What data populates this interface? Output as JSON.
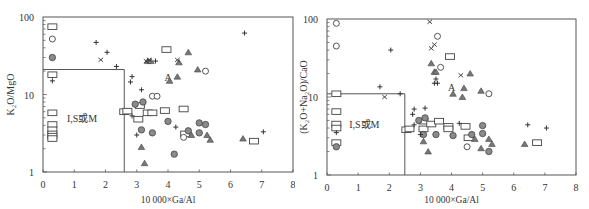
{
  "chart_data": [
    {
      "type": "scatter",
      "title": "",
      "xlabel": "10 000×Ga/Al",
      "ylabel": "K2O/MgO",
      "ylabel_display": "K₂O/MgO",
      "xlim": [
        0,
        8
      ],
      "ylim": [
        1,
        100
      ],
      "yscale": "log",
      "xticks": [
        "0",
        "1",
        "2",
        "3",
        "4",
        "5",
        "6",
        "7",
        "8"
      ],
      "yticks": [
        "1",
        "10",
        "100"
      ],
      "grid": false,
      "field_labels": [
        {
          "text": "I,S或M",
          "x": 1.25,
          "y": 5.0
        },
        {
          "text": "A",
          "x": 4.0,
          "y": 17.0
        }
      ],
      "boundary": {
        "x": 2.6,
        "y": 21
      },
      "series": [
        {
          "name": "square",
          "marker": "open-square",
          "points": [
            [
              0.3,
              75
            ],
            [
              0.3,
              18
            ],
            [
              0.3,
              5.8
            ],
            [
              0.3,
              4.1
            ],
            [
              0.3,
              3.5
            ],
            [
              0.3,
              3.1
            ],
            [
              0.3,
              2.9
            ],
            [
              0.3,
              2.7
            ],
            [
              2.6,
              6.0
            ],
            [
              2.7,
              6.1
            ],
            [
              3.05,
              4.8
            ],
            [
              3.1,
              7.2
            ],
            [
              3.35,
              5.8
            ],
            [
              3.5,
              5.8
            ],
            [
              3.9,
              6.2
            ],
            [
              3.95,
              38
            ],
            [
              4.5,
              6.5
            ],
            [
              4.55,
              3.1
            ],
            [
              6.75,
              2.5
            ]
          ]
        },
        {
          "name": "open-circle",
          "marker": "open-circle",
          "points": [
            [
              0.3,
              52
            ],
            [
              3.5,
              9.5
            ],
            [
              3.65,
              9.5
            ],
            [
              4.5,
              2.8
            ],
            [
              5.2,
              20
            ]
          ]
        },
        {
          "name": "filled-circle",
          "marker": "filled-circle",
          "points": [
            [
              0.3,
              30
            ],
            [
              2.95,
              7.5
            ],
            [
              3.2,
              8.0
            ],
            [
              3.15,
              3.5
            ],
            [
              3.5,
              3.2
            ],
            [
              4.0,
              4.5
            ],
            [
              4.2,
              1.7
            ],
            [
              4.65,
              3.4
            ],
            [
              5.0,
              4.3
            ],
            [
              5.0,
              3.2
            ],
            [
              5.2,
              4.1
            ]
          ]
        },
        {
          "name": "filled-triangle",
          "marker": "triangle",
          "points": [
            [
              3.15,
              2.1
            ],
            [
              3.25,
              1.3
            ],
            [
              3.35,
              27
            ],
            [
              3.45,
              27
            ],
            [
              4.05,
              15
            ],
            [
              4.3,
              17
            ],
            [
              4.35,
              26
            ],
            [
              4.65,
              35
            ],
            [
              4.75,
              3.0
            ],
            [
              4.95,
              21
            ],
            [
              5.25,
              3.0
            ],
            [
              5.35,
              2.6
            ],
            [
              6.4,
              2.7
            ]
          ]
        },
        {
          "name": "plus",
          "marker": "plus",
          "points": [
            [
              0.3,
              15
            ],
            [
              1.7,
              47
            ],
            [
              2.05,
              35
            ],
            [
              2.35,
              23
            ],
            [
              2.8,
              14.5
            ],
            [
              2.85,
              17
            ],
            [
              3.15,
              11.5
            ],
            [
              2.85,
              5.3
            ],
            [
              3.0,
              3.0
            ],
            [
              3.6,
              27
            ],
            [
              4.25,
              3.8
            ],
            [
              6.45,
              62
            ],
            [
              7.05,
              3.3
            ]
          ]
        },
        {
          "name": "cross",
          "marker": "x",
          "points": [
            [
              1.85,
              28
            ],
            [
              3.3,
              27
            ],
            [
              3.4,
              28
            ],
            [
              4.3,
              28
            ]
          ]
        }
      ]
    },
    {
      "type": "scatter",
      "title": "",
      "xlabel": "10 000×Ga/Al",
      "ylabel": "(K2O+Na2O)/CaO",
      "ylabel_display": "(K₂O+Na₂O)/CaO",
      "xlim": [
        0,
        8
      ],
      "ylim": [
        1,
        100
      ],
      "yscale": "log",
      "xticks": [
        "0",
        "1",
        "2",
        "3",
        "4",
        "5",
        "6",
        "7",
        "8"
      ],
      "yticks": [
        "1",
        "10",
        "100"
      ],
      "grid": false,
      "field_labels": [
        {
          "text": "I,S或M",
          "x": 1.2,
          "y": 4.5
        },
        {
          "text": "A",
          "x": 4.0,
          "y": 13.5
        }
      ],
      "boundary": {
        "x": 2.5,
        "y": 11
      },
      "series": [
        {
          "name": "square",
          "marker": "open-square",
          "points": [
            [
              0.3,
              11
            ],
            [
              0.3,
              6.5
            ],
            [
              0.3,
              4.5
            ],
            [
              0.3,
              4.0
            ],
            [
              0.3,
              2.6
            ],
            [
              2.55,
              3.8
            ],
            [
              2.65,
              3.9
            ],
            [
              3.1,
              4.9
            ],
            [
              3.1,
              3.9
            ],
            [
              3.35,
              4.5
            ],
            [
              3.6,
              4.9
            ],
            [
              3.9,
              4.2
            ],
            [
              3.9,
              3.9
            ],
            [
              3.95,
              33
            ],
            [
              4.45,
              4.2
            ],
            [
              4.55,
              3.0
            ],
            [
              6.75,
              2.6
            ]
          ]
        },
        {
          "name": "open-circle",
          "marker": "open-circle",
          "points": [
            [
              0.3,
              88
            ],
            [
              0.3,
              45
            ],
            [
              3.55,
              60
            ],
            [
              3.65,
              24
            ],
            [
              4.5,
              2.3
            ],
            [
              5.2,
              11
            ]
          ]
        },
        {
          "name": "filled-circle",
          "marker": "filled-circle",
          "points": [
            [
              0.3,
              2.3
            ],
            [
              2.95,
              5.0
            ],
            [
              3.15,
              5.4
            ],
            [
              3.1,
              3.3
            ],
            [
              3.5,
              3.3
            ],
            [
              4.05,
              3.2
            ],
            [
              4.65,
              3.3
            ],
            [
              5.0,
              4.3
            ],
            [
              5.0,
              3.4
            ],
            [
              5.2,
              2.0
            ]
          ]
        },
        {
          "name": "filled-triangle",
          "marker": "triangle",
          "points": [
            [
              3.1,
              2.7
            ],
            [
              3.25,
              2.0
            ],
            [
              3.35,
              27
            ],
            [
              3.45,
              21
            ],
            [
              3.5,
              21
            ],
            [
              4.05,
              11
            ],
            [
              4.35,
              10
            ],
            [
              4.4,
              13
            ],
            [
              4.6,
              20
            ],
            [
              4.75,
              2.9
            ],
            [
              4.95,
              2.2
            ],
            [
              4.95,
              12
            ],
            [
              5.2,
              2.9
            ],
            [
              5.3,
              2.5
            ],
            [
              6.35,
              2.5
            ]
          ]
        },
        {
          "name": "plus",
          "marker": "plus",
          "points": [
            [
              0.3,
              3.5
            ],
            [
              1.7,
              13.5
            ],
            [
              2.05,
              40
            ],
            [
              2.35,
              11
            ],
            [
              2.75,
              6.0
            ],
            [
              2.8,
              7.0
            ],
            [
              2.8,
              4.4
            ],
            [
              3.0,
              3.3
            ],
            [
              3.15,
              7.2
            ],
            [
              3.45,
              15
            ],
            [
              3.55,
              15
            ],
            [
              3.5,
              17
            ],
            [
              4.25,
              4.6
            ],
            [
              6.45,
              4.4
            ],
            [
              7.05,
              4.0
            ]
          ]
        },
        {
          "name": "cross",
          "marker": "x",
          "points": [
            [
              1.85,
              10
            ],
            [
              3.3,
              92
            ],
            [
              3.35,
              42
            ],
            [
              3.45,
              47
            ],
            [
              4.3,
              19
            ]
          ]
        }
      ]
    }
  ]
}
